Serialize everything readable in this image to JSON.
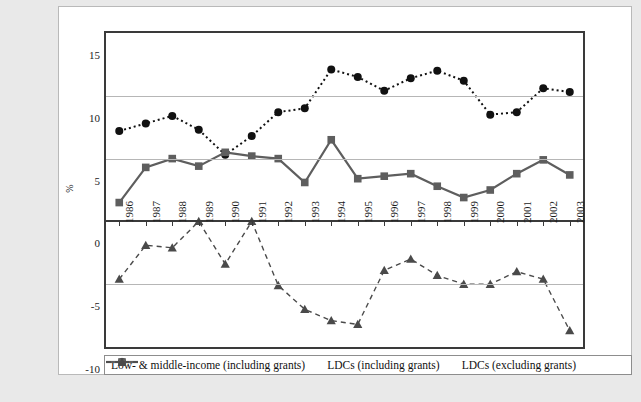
{
  "chart_data": {
    "type": "line",
    "title": "",
    "subtitle": "",
    "xlabel": "",
    "ylabel": "%",
    "ylim": [
      -10,
      15
    ],
    "yticks": [
      15,
      10,
      5,
      0,
      -5,
      -10
    ],
    "grid": true,
    "legend_position": "bottom",
    "categories": [
      "1986",
      "1987",
      "1988",
      "1989",
      "1990",
      "1991",
      "1992",
      "1993",
      "1994",
      "1995",
      "1996",
      "1997",
      "1998",
      "1999",
      "2000",
      "2001",
      "2002",
      "2003"
    ],
    "series": [
      {
        "name": "Low- & middle-income (including grants)",
        "marker": "circle",
        "line": "dotted",
        "color": "#111111",
        "values": [
          7.2,
          7.8,
          8.4,
          7.3,
          5.3,
          6.8,
          8.7,
          9.0,
          12.1,
          11.5,
          10.4,
          11.4,
          12.0,
          11.2,
          8.5,
          8.7,
          10.6,
          10.3
        ]
      },
      {
        "name": "LDCs (including grants)",
        "marker": "square",
        "line": "solid",
        "color": "#5e5e5e",
        "values": [
          1.5,
          4.3,
          5.0,
          4.4,
          5.5,
          5.2,
          5.0,
          3.1,
          6.5,
          3.4,
          3.6,
          3.8,
          2.8,
          1.9,
          2.5,
          3.8,
          4.9,
          3.7
        ]
      },
      {
        "name": "LDCs (excluding grants)",
        "marker": "triangle",
        "line": "dashed",
        "color": "#4a4a4a",
        "values": [
          -4.6,
          -1.9,
          -2.1,
          0.0,
          -3.4,
          0.0,
          -5.1,
          -7.0,
          -7.9,
          -8.2,
          -3.9,
          -3.0,
          -4.3,
          -5.0,
          -5.0,
          -4.0,
          -4.6,
          -8.7
        ]
      }
    ]
  },
  "legend": {
    "items": [
      {
        "label": "Low- & middle-income (including grants)",
        "symbol": "circle-dotted-marker"
      },
      {
        "label": "LDCs (including grants)",
        "symbol": "square-solid-marker"
      },
      {
        "label": "LDCs (excluding grants)",
        "symbol": "triangle-dashed-marker"
      }
    ]
  },
  "axis": {
    "y_title": "%",
    "y_ticks": [
      "15",
      "10",
      "5",
      "0",
      "-5",
      "-10"
    ],
    "x_ticks": [
      "1986",
      "1987",
      "1988",
      "1989",
      "1990",
      "1991",
      "1992",
      "1993",
      "1994",
      "1995",
      "1996",
      "1997",
      "1998",
      "1999",
      "2000",
      "2001",
      "2002",
      "2003"
    ]
  }
}
